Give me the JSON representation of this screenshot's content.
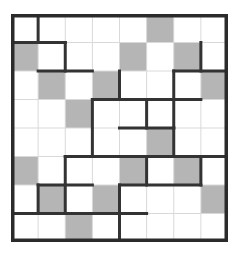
{
  "puzzle": {
    "title": "shaded-cell grid puzzle",
    "type": "grid-region-puzzle",
    "rows": 8,
    "cols": 8,
    "cell_width": 27.125,
    "cell_height": 28.5,
    "colors": {
      "background": "#ffffff",
      "shaded_cell": "#b5b5b5",
      "empty_cell": "#ffffff",
      "thin_gridline": "#d9d9d9",
      "thick_border": "#333333",
      "outer_border": "#2b2b2b"
    },
    "line_widths": {
      "thin": 1,
      "thick": 3,
      "outer": 3.5
    },
    "shaded_cells": [
      [
        1,
        6
      ],
      [
        2,
        1
      ],
      [
        2,
        5
      ],
      [
        2,
        7
      ],
      [
        3,
        2
      ],
      [
        3,
        4
      ],
      [
        3,
        8
      ],
      [
        4,
        3
      ],
      [
        5,
        6
      ],
      [
        6,
        1
      ],
      [
        6,
        5
      ],
      [
        6,
        7
      ],
      [
        7,
        2
      ],
      [
        7,
        4
      ],
      [
        7,
        8
      ],
      [
        8,
        3
      ]
    ],
    "shaded_count": 16,
    "thick_segments_horizontal": [
      {
        "row_boundary": 1,
        "col_start": 1,
        "col_end": 2
      },
      {
        "row_boundary": 2,
        "col_start": 2,
        "col_end": 3
      },
      {
        "row_boundary": 2,
        "col_start": 7,
        "col_end": 8
      },
      {
        "row_boundary": 3,
        "col_start": 4,
        "col_end": 5
      },
      {
        "row_boundary": 3,
        "col_start": 6,
        "col_end": 7
      },
      {
        "row_boundary": 4,
        "col_start": 5,
        "col_end": 6
      },
      {
        "row_boundary": 5,
        "col_start": 3,
        "col_end": 4
      },
      {
        "row_boundary": 5,
        "col_start": 6,
        "col_end": 8
      },
      {
        "row_boundary": 5,
        "col_start": 4,
        "col_end": 5
      },
      {
        "row_boundary": 6,
        "col_start": 2,
        "col_end": 3
      },
      {
        "row_boundary": 6,
        "col_start": 5,
        "col_end": 7
      },
      {
        "row_boundary": 7,
        "col_start": 1,
        "col_end": 2
      },
      {
        "row_boundary": 7,
        "col_start": 3,
        "col_end": 4
      },
      {
        "row_boundary": 7,
        "col_start": 4,
        "col_end": 5
      }
    ],
    "thick_segments_vertical": [
      {
        "col_boundary": 1,
        "row_start": 1,
        "row_end": 2
      },
      {
        "col_boundary": 2,
        "row_start": 2,
        "row_end": 3
      },
      {
        "col_boundary": 4,
        "row_start": 3,
        "row_end": 4
      },
      {
        "col_boundary": 3,
        "row_start": 4,
        "row_end": 6
      },
      {
        "col_boundary": 5,
        "row_start": 4,
        "row_end": 5
      },
      {
        "col_boundary": 6,
        "row_start": 3,
        "row_end": 5
      },
      {
        "col_boundary": 7,
        "row_start": 2,
        "row_end": 3
      },
      {
        "col_boundary": 6,
        "row_start": 5,
        "row_end": 6
      },
      {
        "col_boundary": 2,
        "row_start": 6,
        "row_end": 8
      },
      {
        "col_boundary": 5,
        "row_start": 6,
        "row_end": 7
      },
      {
        "col_boundary": 7,
        "row_start": 6,
        "row_end": 7
      },
      {
        "col_boundary": 4,
        "row_start": 7,
        "row_end": 9
      },
      {
        "col_boundary": 1,
        "row_start": 7,
        "row_end": 8
      }
    ]
  }
}
